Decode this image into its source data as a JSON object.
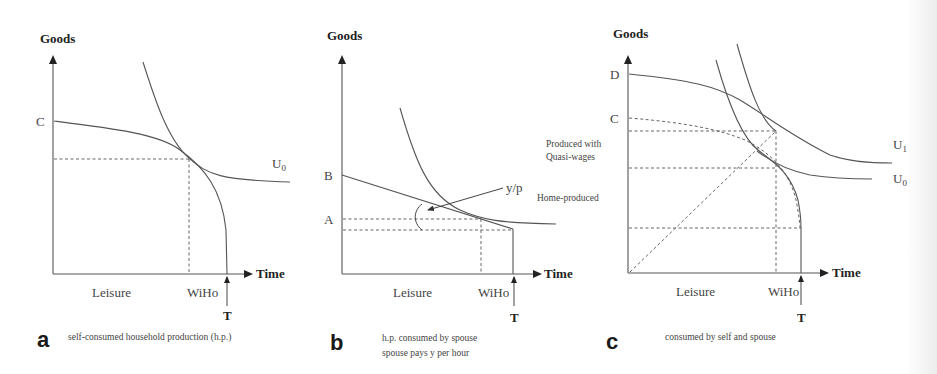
{
  "figure": {
    "panels": [
      {
        "id": "a",
        "letter": "a",
        "caption_lines": [
          "self-consumed household production (h.p.)"
        ],
        "y_axis_label": "Goods",
        "x_axis_label": "Time",
        "leisure_label": "Leisure",
        "wiho_label": "WiHo",
        "t_label": "T",
        "point_labels": [
          {
            "text": "C",
            "role": "production-frontier-intercept"
          }
        ],
        "curve_labels": [
          {
            "text": "U",
            "sub": "0",
            "role": "indifference-curve"
          }
        ],
        "annotations": []
      },
      {
        "id": "b",
        "letter": "b",
        "caption_lines": [
          "h.p. consumed by spouse",
          "spouse pays y per hour"
        ],
        "y_axis_label": "Goods",
        "x_axis_label": "Time",
        "leisure_label": "Leisure",
        "wiho_label": "WiHo",
        "t_label": "T",
        "point_labels": [
          {
            "text": "B",
            "role": "budget-line-intercept"
          },
          {
            "text": "A",
            "role": "consumption-level"
          }
        ],
        "curve_labels": [],
        "annotations": [
          {
            "text": "y/p",
            "role": "budget-line-slope"
          }
        ]
      },
      {
        "id": "c",
        "letter": "c",
        "caption_lines": [
          "consumed by self and spouse"
        ],
        "y_axis_label": "Goods",
        "x_axis_label": "Time",
        "leisure_label": "Leisure",
        "wiho_label": "WiHo",
        "t_label": "T",
        "point_labels": [
          {
            "text": "D",
            "role": "combined-frontier-intercept"
          },
          {
            "text": "C",
            "role": "home-production-intercept"
          }
        ],
        "curve_labels": [
          {
            "text": "U",
            "sub": "1",
            "role": "higher-indifference-curve"
          },
          {
            "text": "U",
            "sub": "0",
            "role": "lower-indifference-curve"
          }
        ],
        "annotations": [
          {
            "text": "Produced with",
            "role": "region-label"
          },
          {
            "text": "Quasi-wages",
            "role": "region-label"
          },
          {
            "text": "Home-produced",
            "role": "region-label"
          }
        ]
      }
    ]
  }
}
